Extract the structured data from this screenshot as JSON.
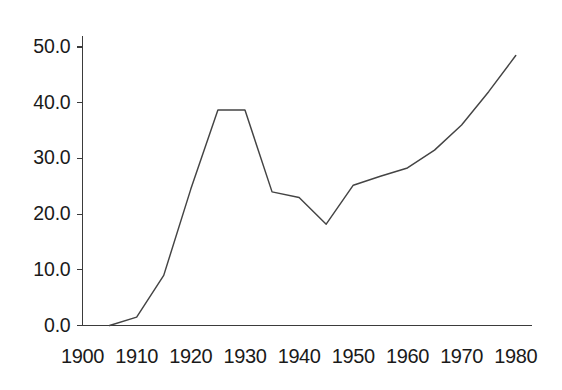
{
  "chart_data": {
    "type": "line",
    "title": "",
    "subtitle": "",
    "xlabel": "",
    "ylabel": "",
    "xlim": [
      1900,
      1983
    ],
    "ylim": [
      0.0,
      52.0
    ],
    "grid": false,
    "legend": null,
    "x_tick_labels": [
      "1900",
      "1910",
      "1920",
      "1930",
      "1940",
      "1950",
      "1960",
      "1970",
      "1980"
    ],
    "x_ticks": [
      1900,
      1910,
      1920,
      1930,
      1940,
      1950,
      1960,
      1970,
      1980
    ],
    "y_tick_labels": [
      "0.0",
      "10.0",
      "20.0",
      "30.0",
      "40.0",
      "50.0"
    ],
    "y_ticks": [
      0.0,
      10.0,
      20.0,
      30.0,
      40.0,
      50.0
    ],
    "series": [
      {
        "name": "series-1",
        "color": "#444444",
        "x": [
          1905,
          1910,
          1915,
          1920,
          1925,
          1930,
          1935,
          1940,
          1945,
          1950,
          1955,
          1960,
          1965,
          1970,
          1975,
          1980
        ],
        "values": [
          0.0,
          1.5,
          9.0,
          24.5,
          38.7,
          38.7,
          24.0,
          23.0,
          18.2,
          25.2,
          26.8,
          28.3,
          31.5,
          36.0,
          42.0,
          48.5
        ]
      }
    ]
  },
  "axis": {
    "line_color": "#3b3b3b"
  }
}
